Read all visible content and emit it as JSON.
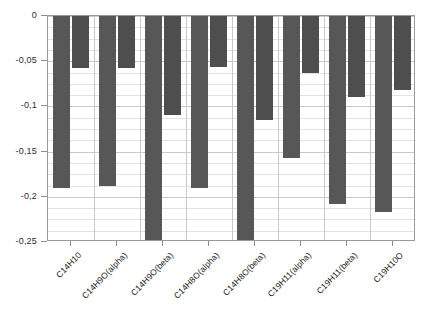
{
  "chart_data": {
    "type": "bar",
    "title": "",
    "xlabel": "",
    "ylabel": "",
    "ylim": [
      -0.25,
      0
    ],
    "grid": true,
    "legend_position": "none",
    "decimal_separator": ",",
    "categories": [
      "C14H10",
      "C14H9O(alpha)",
      "C14H9O(beta)",
      "C14H8O(alpha)",
      "C14H8O(beta)",
      "C19H11(alpha)",
      "C19H11(beta)",
      "C19H10O"
    ],
    "ytick_labels": [
      "0",
      "-0,05",
      "-0,1",
      "-0,15",
      "-0,2",
      "-0,25"
    ],
    "ytick_values": [
      0,
      -0.05,
      -0.1,
      -0.15,
      -0.2,
      -0.25
    ],
    "series": [
      {
        "name": "series-1",
        "color": "#575757",
        "values": [
          -0.19,
          -0.188,
          -0.248,
          -0.19,
          -0.25,
          -0.157,
          -0.208,
          -0.217
        ]
      },
      {
        "name": "series-2",
        "color": "#4e4e4e",
        "values": [
          -0.057,
          -0.058,
          -0.11,
          -0.056,
          -0.115,
          -0.063,
          -0.09,
          -0.082
        ]
      }
    ]
  }
}
